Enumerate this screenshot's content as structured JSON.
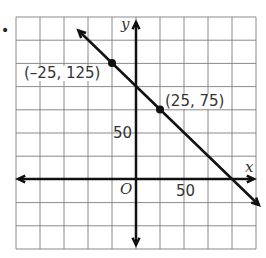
{
  "chart_data": {
    "type": "line",
    "title": "",
    "xlabel": "x",
    "ylabel": "y",
    "origin_label": "O",
    "x_tick_labels": [
      {
        "value": 50,
        "label": "50"
      }
    ],
    "y_tick_labels": [
      {
        "value": 50,
        "label": "50"
      }
    ],
    "xlim": [
      -100,
      125
    ],
    "ylim": [
      -75,
      175
    ],
    "grid": true,
    "grid_step": 25,
    "series": [
      {
        "name": "line",
        "x": [
          -25,
          25
        ],
        "y": [
          125,
          75
        ],
        "equation": "y = -x + 100"
      }
    ],
    "points": [
      {
        "x": -25,
        "y": 125,
        "label": "(–25, 125)"
      },
      {
        "x": 25,
        "y": 75,
        "label": "(25, 75)"
      }
    ]
  },
  "bullet": "•"
}
